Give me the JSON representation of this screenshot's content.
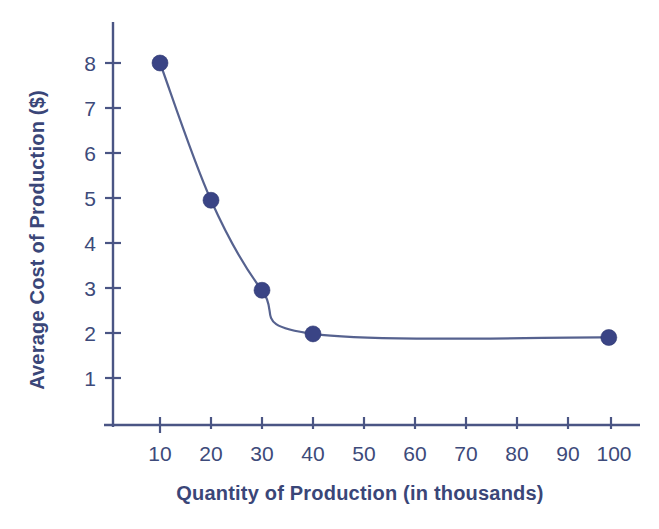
{
  "chart_data": {
    "type": "line",
    "title": "",
    "subtitle": "",
    "xlabel": "Quantity of Production (in thousands)",
    "ylabel": "Average Cost of Production ($)",
    "x": [
      10,
      20,
      30,
      40,
      98
    ],
    "values": [
      8.0,
      4.95,
      2.95,
      1.98,
      1.9
    ],
    "series": [
      {
        "name": "Average Cost of Production",
        "x": [
          10,
          20,
          30,
          40,
          98
        ],
        "values": [
          8.0,
          4.95,
          2.95,
          1.98,
          1.9
        ]
      }
    ],
    "xtick_labels": [
      "10",
      "20",
      "30",
      "40",
      "50",
      "60",
      "70",
      "80",
      "90",
      "100"
    ],
    "xtick_values": [
      10,
      20,
      30,
      40,
      50,
      60,
      70,
      80,
      90,
      100
    ],
    "ytick_labels": [
      "1",
      "2",
      "3",
      "4",
      "5",
      "6",
      "7",
      "8"
    ],
    "ytick_values": [
      1,
      2,
      3,
      4,
      5,
      6,
      7,
      8
    ],
    "xlim": [
      0,
      108
    ],
    "ylim": [
      0,
      9
    ],
    "grid": false,
    "legend": "none",
    "marker": "filled-circle",
    "line_color": "#56628f",
    "marker_color": "#3a4485",
    "axis_color": "#4a5584",
    "text_color": "#3d4a7a",
    "background_color": "#ffffff"
  },
  "axes": {
    "y_title": "Average Cost of Production ($)",
    "x_title": "Quantity of Production (in thousands)",
    "y_ticks": [
      {
        "label": "8"
      },
      {
        "label": "7"
      },
      {
        "label": "6"
      },
      {
        "label": "5"
      },
      {
        "label": "4"
      },
      {
        "label": "3"
      },
      {
        "label": "2"
      },
      {
        "label": "1"
      }
    ],
    "x_ticks": [
      {
        "label": "10"
      },
      {
        "label": "20"
      },
      {
        "label": "30"
      },
      {
        "label": "40"
      },
      {
        "label": "50"
      },
      {
        "label": "60"
      },
      {
        "label": "70"
      },
      {
        "label": "80"
      },
      {
        "label": "90"
      },
      {
        "label": "100"
      }
    ]
  }
}
